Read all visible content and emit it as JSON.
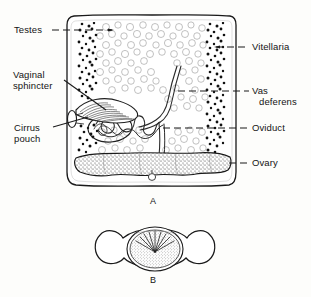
{
  "figure": {
    "ink_color": "#1a1a1a",
    "background_color": "#fdfdfb",
    "panels": [
      {
        "id": "A",
        "letter": "A",
        "caption": "A",
        "subject": "mature proglottid, ventral view"
      },
      {
        "id": "B",
        "letter": "B",
        "caption": "B",
        "subject": "egg with radiating hooklets"
      }
    ]
  },
  "labels": {
    "left": [
      {
        "key": "testes",
        "text": "Testes",
        "lines": [
          "Testes"
        ]
      },
      {
        "key": "vaginal_sphincter",
        "text": "Vaginal sphincter",
        "lines": [
          "Vaginal",
          "sphincter"
        ]
      },
      {
        "key": "cirrus_pouch",
        "text": "Cirrus pouch",
        "lines": [
          "Cirrus",
          "pouch"
        ]
      }
    ],
    "right": [
      {
        "key": "vitellaria",
        "text": "Vitellaria",
        "lines": [
          "Vitellaria"
        ]
      },
      {
        "key": "vas_deferens",
        "text": "Vas deferens",
        "lines": [
          "Vas",
          "deferens"
        ]
      },
      {
        "key": "oviduct",
        "text": "Oviduct",
        "lines": [
          "Oviduct"
        ]
      },
      {
        "key": "ovary",
        "text": "Ovary",
        "lines": [
          "Ovary"
        ]
      }
    ]
  },
  "label_text": {
    "testes": "Testes",
    "vaginal_1": "Vaginal",
    "vaginal_2": "sphincter",
    "cirrus_1": "Cirrus",
    "cirrus_2": "pouch",
    "vitellaria": "Vitellaria",
    "vas_1": "Vas",
    "vas_2": "deferens",
    "oviduct": "Oviduct",
    "ovary": "Ovary",
    "panel_a": "A",
    "panel_b": "B"
  }
}
